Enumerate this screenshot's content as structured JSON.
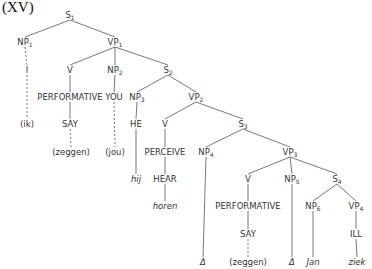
{
  "title": "(XV)",
  "nodes": [
    {
      "id": "S1",
      "text": "S",
      "sub": "1",
      "x": 70,
      "y": 18
    },
    {
      "id": "NP1",
      "text": "NP",
      "sub": "1",
      "x": 25,
      "y": 45
    },
    {
      "id": "VP1",
      "text": "VP",
      "sub": "1",
      "x": 115,
      "y": 45
    },
    {
      "id": "I",
      "text": "I",
      "x": 27,
      "y": 73
    },
    {
      "id": "V1",
      "text": "V",
      "x": 70,
      "y": 73
    },
    {
      "id": "NP2",
      "text": "NP",
      "sub": "2",
      "x": 115,
      "y": 73
    },
    {
      "id": "S2",
      "text": "S",
      "sub": "2",
      "x": 168,
      "y": 73
    },
    {
      "id": "PERF1",
      "text": "PERFORMATIVE",
      "x": 70,
      "y": 100
    },
    {
      "id": "YOU",
      "text": "YOU",
      "x": 114,
      "y": 100
    },
    {
      "id": "NP3",
      "text": "NP",
      "sub": "3",
      "x": 137,
      "y": 100
    },
    {
      "id": "VP2",
      "text": "VP",
      "sub": "2",
      "x": 196,
      "y": 100
    },
    {
      "id": "ik",
      "text": "(ik)",
      "x": 27,
      "y": 127
    },
    {
      "id": "SAY1",
      "text": "SAY",
      "x": 70,
      "y": 127
    },
    {
      "id": "HE",
      "text": "HE",
      "x": 136,
      "y": 127
    },
    {
      "id": "V2",
      "text": "V",
      "x": 165,
      "y": 127
    },
    {
      "id": "S3",
      "text": "S",
      "sub": "3",
      "x": 243,
      "y": 127
    },
    {
      "id": "zeggen1",
      "text": "(zeggen)",
      "x": 71,
      "y": 155
    },
    {
      "id": "jou",
      "text": "(jou)",
      "x": 115,
      "y": 155
    },
    {
      "id": "PERCEIVE",
      "text": "PERCEIVE",
      "x": 165,
      "y": 155
    },
    {
      "id": "NP4",
      "text": "NP",
      "sub": "4",
      "x": 206,
      "y": 155
    },
    {
      "id": "VP3",
      "text": "VP",
      "sub": "3",
      "x": 290,
      "y": 155
    },
    {
      "id": "hij",
      "text": "hij",
      "x": 136,
      "y": 182,
      "italic": true
    },
    {
      "id": "HEAR",
      "text": "HEAR",
      "x": 165,
      "y": 182
    },
    {
      "id": "V3",
      "text": "V",
      "x": 248,
      "y": 182
    },
    {
      "id": "NP5",
      "text": "NP",
      "sub": "5",
      "x": 292,
      "y": 182
    },
    {
      "id": "S4",
      "text": "S",
      "sub": "4",
      "x": 337,
      "y": 182
    },
    {
      "id": "horen",
      "text": "horen",
      "x": 165,
      "y": 209,
      "italic": true
    },
    {
      "id": "PERF2",
      "text": "PERFORMATIVE",
      "x": 248,
      "y": 209
    },
    {
      "id": "NP6",
      "text": "NP",
      "sub": "6",
      "x": 313,
      "y": 209
    },
    {
      "id": "VP4",
      "text": "VP",
      "sub": "4",
      "x": 356,
      "y": 209
    },
    {
      "id": "SAY2",
      "text": "SAY",
      "x": 248,
      "y": 237
    },
    {
      "id": "ILL",
      "text": "ILL",
      "x": 356,
      "y": 237
    },
    {
      "id": "delta1",
      "text": "Δ",
      "x": 203,
      "y": 265,
      "italic": true
    },
    {
      "id": "zeggen2",
      "text": "(zeggen)",
      "x": 248,
      "y": 265
    },
    {
      "id": "delta2",
      "text": "Δ",
      "x": 292,
      "y": 265,
      "italic": true
    },
    {
      "id": "Jan",
      "text": "Jan",
      "x": 313,
      "y": 265,
      "italic": true
    },
    {
      "id": "ziek",
      "text": "ziek",
      "x": 357,
      "y": 265,
      "italic": true
    }
  ],
  "edges": [
    {
      "from": "S1",
      "to": "NP1"
    },
    {
      "from": "S1",
      "to": "VP1"
    },
    {
      "from": "NP1",
      "to": "I",
      "dashed": true
    },
    {
      "from": "VP1",
      "to": "V1"
    },
    {
      "from": "VP1",
      "to": "NP2"
    },
    {
      "from": "VP1",
      "to": "S2"
    },
    {
      "from": "I",
      "to": "ik",
      "dashed": true
    },
    {
      "from": "V1",
      "to": "PERF1"
    },
    {
      "from": "PERF1",
      "to": "SAY1"
    },
    {
      "from": "SAY1",
      "to": "zeggen1",
      "dashed": true
    },
    {
      "from": "NP2",
      "to": "YOU"
    },
    {
      "from": "YOU",
      "to": "jou",
      "dashed": true
    },
    {
      "from": "S2",
      "to": "NP3"
    },
    {
      "from": "S2",
      "to": "VP2"
    },
    {
      "from": "NP3",
      "to": "HE"
    },
    {
      "from": "HE",
      "to": "hij"
    },
    {
      "from": "VP2",
      "to": "V2"
    },
    {
      "from": "VP2",
      "to": "S3"
    },
    {
      "from": "V2",
      "to": "PERCEIVE"
    },
    {
      "from": "PERCEIVE",
      "to": "HEAR"
    },
    {
      "from": "HEAR",
      "to": "horen"
    },
    {
      "from": "S3",
      "to": "NP4"
    },
    {
      "from": "S3",
      "to": "VP3"
    },
    {
      "from": "NP4",
      "to": "delta1"
    },
    {
      "from": "VP3",
      "to": "V3"
    },
    {
      "from": "VP3",
      "to": "NP5"
    },
    {
      "from": "VP3",
      "to": "S4"
    },
    {
      "from": "V3",
      "to": "PERF2"
    },
    {
      "from": "PERF2",
      "to": "SAY2"
    },
    {
      "from": "SAY2",
      "to": "zeggen2",
      "dashed": true
    },
    {
      "from": "NP5",
      "to": "delta2"
    },
    {
      "from": "S4",
      "to": "NP6"
    },
    {
      "from": "S4",
      "to": "VP4"
    },
    {
      "from": "NP6",
      "to": "Jan"
    },
    {
      "from": "VP4",
      "to": "ILL"
    },
    {
      "from": "ILL",
      "to": "ziek"
    }
  ]
}
